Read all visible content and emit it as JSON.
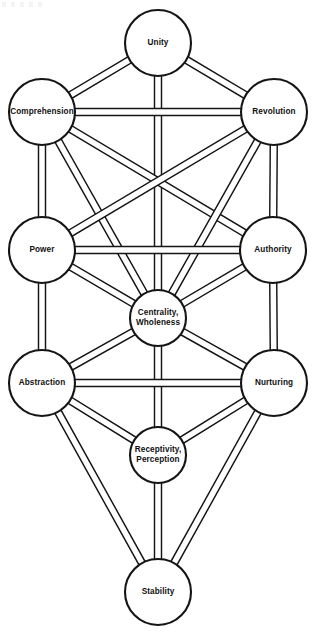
{
  "diagram": {
    "type": "node-link-graph",
    "width": 317,
    "height": 633,
    "background_color": "#ffffff",
    "line_color": "#151515",
    "node_fill": "#ffffff",
    "edge_style": "hollow-ribbon",
    "edge_band_width": 7,
    "nodes": [
      {
        "id": "unity",
        "label": "Unity",
        "lines": [
          "Unity"
        ],
        "cx": 158,
        "cy": 43,
        "r": 33,
        "column": "center"
      },
      {
        "id": "comprehension",
        "label": "Comprehension",
        "lines": [
          "Comprehension"
        ],
        "cx": 42,
        "cy": 112,
        "r": 33,
        "column": "left"
      },
      {
        "id": "revolution",
        "label": "Revolution",
        "lines": [
          "Revolution"
        ],
        "cx": 274,
        "cy": 112,
        "r": 33,
        "column": "right"
      },
      {
        "id": "power",
        "label": "Power",
        "lines": [
          "Power"
        ],
        "cx": 42,
        "cy": 250,
        "r": 33,
        "column": "left"
      },
      {
        "id": "authority",
        "label": "Authority",
        "lines": [
          "Authority"
        ],
        "cx": 273,
        "cy": 250,
        "r": 33,
        "column": "right"
      },
      {
        "id": "centrality",
        "label": "Centrality, Wholeness",
        "lines": [
          "Centrality,",
          "Wholeness"
        ],
        "cx": 158,
        "cy": 318,
        "r": 28,
        "column": "center"
      },
      {
        "id": "abstraction",
        "label": "Abstraction",
        "lines": [
          "Abstraction"
        ],
        "cx": 42,
        "cy": 383,
        "r": 33,
        "column": "left"
      },
      {
        "id": "nurturing",
        "label": "Nurturing",
        "lines": [
          "Nurturing"
        ],
        "cx": 274,
        "cy": 383,
        "r": 33,
        "column": "right"
      },
      {
        "id": "receptivity",
        "label": "Receptivity, Perception",
        "lines": [
          "Receptivity,",
          "Perception"
        ],
        "cx": 158,
        "cy": 455,
        "r": 28,
        "column": "center"
      },
      {
        "id": "stability",
        "label": "Stability",
        "lines": [
          "Stability"
        ],
        "cx": 158,
        "cy": 592,
        "r": 33,
        "column": "center"
      }
    ],
    "edges": [
      {
        "from": "unity",
        "to": "comprehension"
      },
      {
        "from": "unity",
        "to": "revolution"
      },
      {
        "from": "unity",
        "to": "centrality"
      },
      {
        "from": "comprehension",
        "to": "revolution"
      },
      {
        "from": "comprehension",
        "to": "power"
      },
      {
        "from": "comprehension",
        "to": "centrality"
      },
      {
        "from": "comprehension",
        "to": "authority"
      },
      {
        "from": "revolution",
        "to": "authority"
      },
      {
        "from": "revolution",
        "to": "centrality"
      },
      {
        "from": "revolution",
        "to": "power"
      },
      {
        "from": "power",
        "to": "authority"
      },
      {
        "from": "power",
        "to": "abstraction"
      },
      {
        "from": "power",
        "to": "centrality"
      },
      {
        "from": "authority",
        "to": "nurturing"
      },
      {
        "from": "authority",
        "to": "centrality"
      },
      {
        "from": "centrality",
        "to": "abstraction"
      },
      {
        "from": "centrality",
        "to": "nurturing"
      },
      {
        "from": "centrality",
        "to": "receptivity"
      },
      {
        "from": "abstraction",
        "to": "nurturing"
      },
      {
        "from": "abstraction",
        "to": "receptivity"
      },
      {
        "from": "abstraction",
        "to": "stability"
      },
      {
        "from": "nurturing",
        "to": "receptivity"
      },
      {
        "from": "nurturing",
        "to": "stability"
      },
      {
        "from": "receptivity",
        "to": "stability"
      }
    ]
  }
}
